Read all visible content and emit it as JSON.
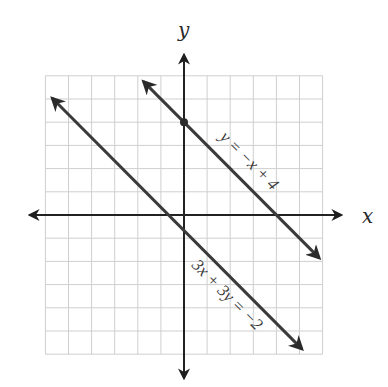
{
  "chart_data": {
    "type": "line",
    "title": "",
    "xlabel": "x",
    "ylabel": "y",
    "xlim": [
      -6,
      6
    ],
    "ylim": [
      -6,
      6
    ],
    "grid": true,
    "grid_step": 1,
    "tick_labels": false,
    "series": [
      {
        "name": "y = −x + 4",
        "equation": "y = -x + 4",
        "slope": -1,
        "intercept": 4,
        "x": [
          -1.75,
          5.85
        ],
        "y": [
          5.75,
          -1.85
        ],
        "arrows": "both",
        "marked_point": {
          "x": 0,
          "y": 4
        }
      },
      {
        "name": "3x + 3y = −2",
        "equation": "3x + 3y = -2",
        "slope": -1,
        "intercept": -0.667,
        "x": [
          -5.7,
          5.1
        ],
        "y": [
          5.03,
          -5.77
        ],
        "arrows": "both"
      }
    ],
    "annotations": [
      "y = −x + 4",
      "3x + 3y = −2"
    ]
  },
  "labels": {
    "x_axis": "x",
    "y_axis": "y",
    "line1": "y = −x + 4",
    "line2": "3x + 3y = −2"
  },
  "colors": {
    "grid": "#cfcfcf",
    "axis": "#222222",
    "line": "#3a3a3a"
  }
}
